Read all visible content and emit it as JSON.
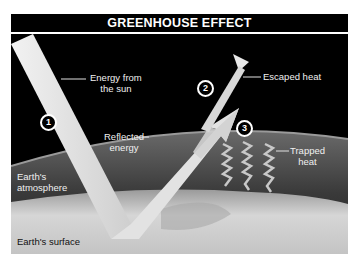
{
  "title": "GREENHOUSE EFFECT",
  "labels": {
    "energy_from_sun_line1": "Energy from",
    "energy_from_sun_line2": "the sun",
    "escaped_heat": "Escaped heat",
    "reflected_energy_line1": "Reflected",
    "reflected_energy_line2": "energy",
    "trapped_heat_line1": "Trapped",
    "trapped_heat_line2": "heat",
    "earths_atmosphere_line1": "Earth's",
    "earths_atmosphere_line2": "atmosphere",
    "earths_surface": "Earth's surface"
  },
  "steps": [
    {
      "number": "1"
    },
    {
      "number": "2"
    },
    {
      "number": "3"
    }
  ],
  "colors": {
    "space": "#000000",
    "atmosphere": "#555555",
    "surface": "#d9d9d9",
    "beam": "#e6e6e6"
  }
}
